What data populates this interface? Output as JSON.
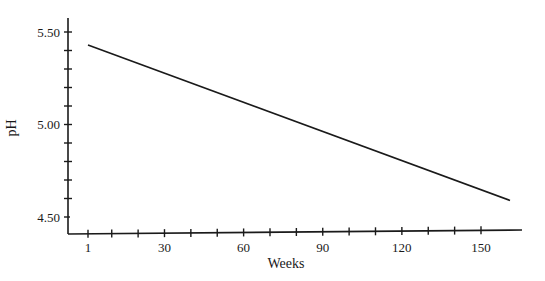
{
  "chart_data": {
    "type": "line",
    "title": "",
    "xlabel": "Weeks",
    "ylabel": "pH",
    "x_ticks": [
      1,
      30,
      60,
      90,
      120,
      150
    ],
    "x_tick_labels": [
      "1",
      "30",
      "60",
      "90",
      "120",
      "150"
    ],
    "y_ticks": [
      4.5,
      5.0,
      5.5
    ],
    "y_tick_labels": [
      "4.50",
      "5.00",
      "5.50"
    ],
    "xlim": [
      -7,
      170
    ],
    "ylim": [
      4.36,
      5.59
    ],
    "grid": false,
    "legend": null,
    "series": [
      {
        "name": "pH",
        "x": [
          1,
          161
        ],
        "y": [
          5.43,
          4.59
        ]
      }
    ]
  }
}
